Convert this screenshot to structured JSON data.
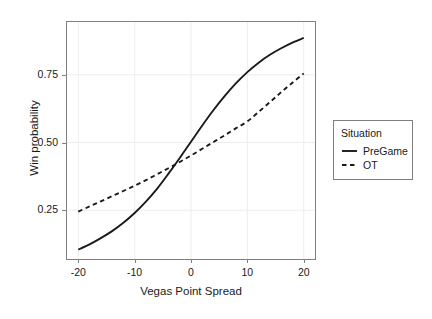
{
  "chart_data": {
    "type": "line",
    "title": "",
    "xlabel": "Vegas Point Spread",
    "ylabel": "Win probability",
    "xlim": [
      -22,
      22
    ],
    "ylim": [
      0.07,
      0.945
    ],
    "xticks": [
      -20,
      -10,
      0,
      10,
      20
    ],
    "xticklabels": [
      "-20",
      "-10",
      "0",
      "10",
      "20"
    ],
    "yticks": [
      0.25,
      0.5,
      0.75
    ],
    "yticklabels": [
      "0.25",
      "0.50",
      "0.75"
    ],
    "grid": true,
    "legend_position": "right",
    "legend_title": "Situation",
    "x": [
      -20,
      -18,
      -16,
      -14,
      -12,
      -10,
      -8,
      -6,
      -4,
      -2,
      0,
      2,
      4,
      6,
      8,
      10,
      12,
      14,
      16,
      18,
      20
    ],
    "series": [
      {
        "name": "PreGame",
        "style": "solid",
        "color": "#1a1a1a",
        "values": [
          0.105,
          0.124,
          0.147,
          0.173,
          0.204,
          0.24,
          0.282,
          0.33,
          0.385,
          0.443,
          0.503,
          0.563,
          0.62,
          0.672,
          0.719,
          0.76,
          0.795,
          0.824,
          0.848,
          0.869,
          0.886
        ]
      },
      {
        "name": "OT",
        "style": "dashed",
        "color": "#1a1a1a",
        "values": [
          0.245,
          0.264,
          0.283,
          0.302,
          0.321,
          0.341,
          0.361,
          0.383,
          0.405,
          0.428,
          0.452,
          0.477,
          0.502,
          0.527,
          0.553,
          0.578,
          0.613,
          0.649,
          0.686,
          0.721,
          0.755
        ]
      }
    ]
  },
  "legend": {
    "title": "Situation",
    "entries": [
      {
        "label": "PreGame",
        "style": "solid"
      },
      {
        "label": "OT",
        "style": "dashed"
      }
    ]
  },
  "axes": {
    "x_title": "Vegas Point Spread",
    "y_title": "Win probability"
  },
  "colors": {
    "line": "#1a1a1a",
    "panel_border": "#808080",
    "grid": "#ededed",
    "background": "#ffffff"
  }
}
